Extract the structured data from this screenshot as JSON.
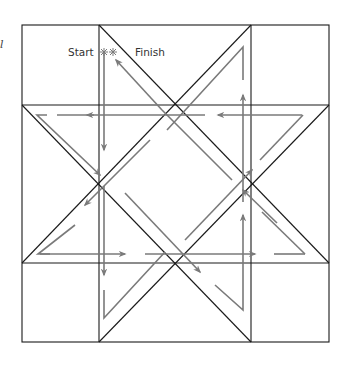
{
  "diagram": {
    "corner_mark": "l",
    "labels": {
      "start": "Start",
      "finish": "Finish"
    },
    "colors": {
      "outline": "#1a1a1a",
      "path": "#7a7a7a",
      "label": "#333333",
      "background": "#ffffff"
    },
    "grid": {
      "outer": {
        "x1": 22,
        "y1": 25,
        "x2": 329,
        "y2": 342
      },
      "columns_x": [
        99,
        251
      ],
      "rows_y": [
        105,
        263
      ]
    },
    "star_vertices": {
      "top": [
        175,
        105
      ],
      "left": [
        99,
        184
      ],
      "right": [
        251,
        184
      ],
      "bottom": [
        175,
        263
      ]
    },
    "start_point": [
      104,
      52
    ],
    "finish_point": [
      113,
      52
    ]
  }
}
